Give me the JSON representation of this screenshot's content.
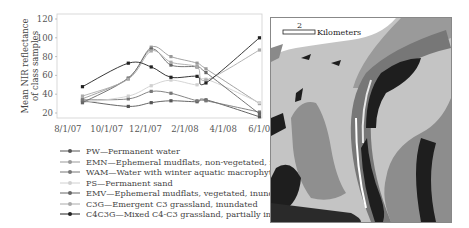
{
  "chart_data": {
    "type": "line",
    "title": "",
    "xlabel": "",
    "ylabel": "Mean NIR reflectance of class samples",
    "ylim": [
      10,
      120
    ],
    "yticks": [
      20,
      40,
      60,
      80,
      100,
      120
    ],
    "xticks": [
      "8/1/07",
      "10/1/07",
      "12/1/07",
      "2/1/08",
      "4/1/08",
      "6/1/08"
    ],
    "x": [
      "8/24/07",
      "11/4/07",
      "12/10/07",
      "1/10/08",
      "2/20/08",
      "3/5/08",
      "5/28/08"
    ],
    "grid": false,
    "legend_position": "below",
    "series": [
      {
        "name": "PW",
        "label": "PW—Permanent water",
        "color": "#555555",
        "values": [
          33,
          27,
          31,
          33,
          32,
          34,
          16
        ]
      },
      {
        "name": "EMN",
        "label": "EMN—Ephemeral mudflats, non-vegetated, inundated",
        "color": "#999999",
        "values": [
          35,
          57,
          90,
          80,
          73,
          67,
          30
        ]
      },
      {
        "name": "WAM",
        "label": "WAM—Water with winter aquatic macrophytes",
        "color": "#777777",
        "values": [
          34,
          35,
          43,
          41,
          33,
          33,
          21
        ]
      },
      {
        "name": "PS",
        "label": "PS—Permanent sand",
        "color": "#d0d0d0",
        "values": [
          31,
          38,
          49,
          55,
          50,
          56,
          31
        ]
      },
      {
        "name": "EMV",
        "label": "EMV—Ephemeral mudflats, vegetated, inundated",
        "color": "#666666",
        "values": [
          31,
          57,
          88,
          71,
          69,
          63,
          19
        ]
      },
      {
        "name": "C3G",
        "label": "C3G—Emergent C3 grassland, inundated",
        "color": "#aaaaaa",
        "values": [
          38,
          56,
          86,
          74,
          69,
          55,
          87
        ]
      },
      {
        "name": "C4C3G",
        "label": "C4C3G—Mixed C4-C3 grassland, partially inundated",
        "color": "#222222",
        "values": [
          48,
          73,
          69,
          58,
          59,
          52,
          100
        ]
      }
    ]
  },
  "map": {
    "scale_value": "2",
    "scale_unit": "Kilometers"
  }
}
